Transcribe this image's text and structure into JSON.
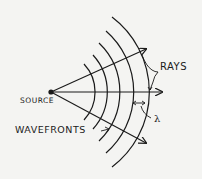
{
  "diagram": {
    "colors": {
      "background": "#f4f4f2",
      "ink": "#1a1a1a"
    },
    "labels": {
      "rays": "RAYS",
      "source": "SOURCE",
      "wavefronts": "WAVEFRONTS",
      "wavelength": "λ"
    },
    "source_point": {
      "x": 51,
      "y": 92
    },
    "rays": [
      {
        "name": "upper-ray",
        "to": {
          "x": 146,
          "y": 48
        }
      },
      {
        "name": "center-ray",
        "to": {
          "x": 162,
          "y": 92
        }
      },
      {
        "name": "lower-ray",
        "to": {
          "x": 146,
          "y": 143
        }
      }
    ],
    "wavefront_radii": [
      41,
      55,
      68,
      81,
      94
    ],
    "wavefront_count": 5
  }
}
